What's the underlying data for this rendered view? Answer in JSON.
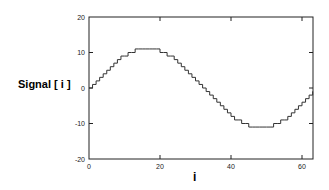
{
  "chart_data": {
    "type": "line",
    "step": true,
    "title": "",
    "xlabel": "i",
    "ylabel": "Signal [ i ]",
    "xlim": [
      0,
      63
    ],
    "ylim": [
      -20,
      20
    ],
    "xticks": [
      0,
      20,
      40,
      60
    ],
    "yticks": [
      -20,
      -10,
      0,
      10,
      20
    ],
    "grid": false,
    "legend": null,
    "series": [
      {
        "name": "Signal",
        "x": [
          0,
          1,
          2,
          3,
          4,
          5,
          6,
          7,
          8,
          9,
          10,
          11,
          12,
          13,
          14,
          15,
          16,
          17,
          18,
          19,
          20,
          21,
          22,
          23,
          24,
          25,
          26,
          27,
          28,
          29,
          30,
          31,
          32,
          33,
          34,
          35,
          36,
          37,
          38,
          39,
          40,
          41,
          42,
          43,
          44,
          45,
          46,
          47,
          48,
          49,
          50,
          51,
          52,
          53,
          54,
          55,
          56,
          57,
          58,
          59,
          60,
          61,
          62,
          63
        ],
        "values": [
          0,
          1,
          2,
          3,
          4,
          5,
          6,
          7,
          8,
          9,
          9,
          10,
          10,
          11,
          11,
          11,
          11,
          11,
          11,
          11,
          10,
          10,
          9,
          9,
          8,
          7,
          6,
          5,
          4,
          3,
          2,
          1,
          0,
          -1,
          -2,
          -3,
          -4,
          -5,
          -6,
          -7,
          -8,
          -9,
          -9,
          -10,
          -10,
          -11,
          -11,
          -11,
          -11,
          -11,
          -11,
          -11,
          -10,
          -10,
          -9,
          -9,
          -8,
          -7,
          -6,
          -5,
          -4,
          -3,
          -2,
          -1
        ]
      }
    ],
    "line_color": "#333333",
    "axis_color": "#222222"
  },
  "labels": {
    "ylabel": "Signal [ i ]",
    "xlabel": "i",
    "xticks": [
      "0",
      "20",
      "40",
      "60"
    ],
    "yticks": [
      "20",
      "10",
      "0",
      "-10",
      "-20"
    ]
  }
}
